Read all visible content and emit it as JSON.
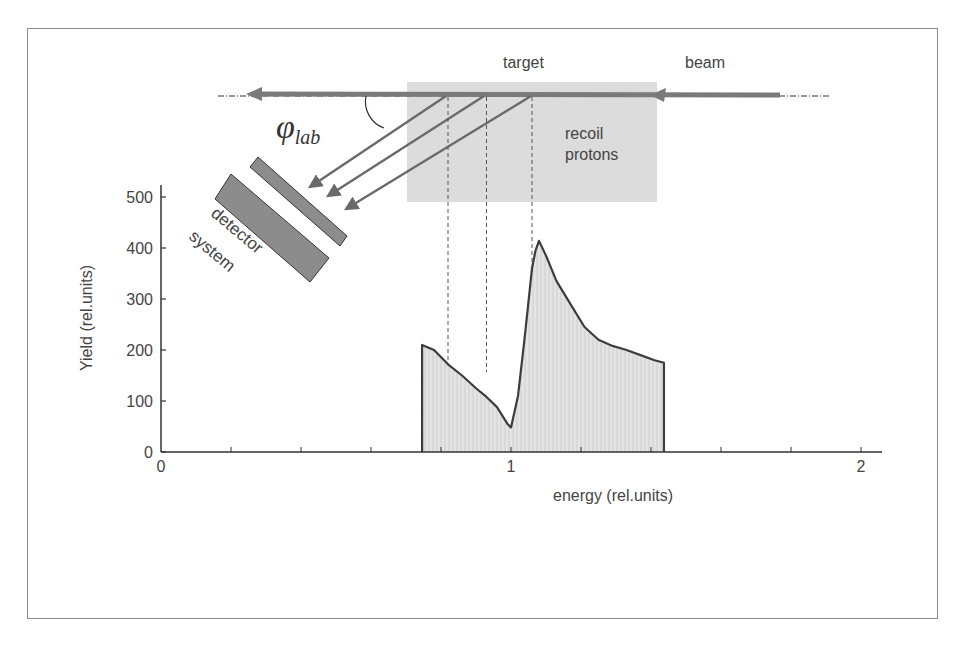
{
  "diagram": {
    "labels": {
      "target": "target",
      "beam": "beam",
      "phi": "φ",
      "phi_sub": "lab",
      "recoil_line1": "recoil",
      "recoil_line2": "protons",
      "detector_line1": "detector",
      "detector_line2": "system"
    },
    "colors": {
      "beam": "#7a7a7a",
      "target_box": "#dcdcdc",
      "detector": "#8c8c8c",
      "arrows": "#6a6a6a",
      "histogram_fill": "#e4e4e4",
      "histogram_outline": "#3c3c3c",
      "axis": "#333333",
      "text": "#444444"
    }
  },
  "chart_data": {
    "type": "area",
    "title": "",
    "xlabel": "energy (rel.units)",
    "ylabel": "Yield (rel.units)",
    "xlim": [
      0,
      2.05
    ],
    "ylim": [
      0,
      520
    ],
    "x_ticks": [
      "0",
      "1",
      "2"
    ],
    "y_ticks": [
      "0",
      "100",
      "200",
      "300",
      "400",
      "500"
    ],
    "grid": false,
    "legend": null,
    "series": [
      {
        "name": "recoil proton spectrum",
        "x": [
          0.746,
          0.78,
          0.82,
          0.86,
          0.9,
          0.93,
          0.96,
          0.99,
          1.0,
          1.02,
          1.04,
          1.06,
          1.07,
          1.08,
          1.1,
          1.13,
          1.17,
          1.21,
          1.25,
          1.29,
          1.33,
          1.37,
          1.41,
          1.437
        ],
        "values": [
          210,
          200,
          172,
          150,
          125,
          108,
          88,
          55,
          48,
          110,
          230,
          360,
          395,
          414,
          385,
          335,
          290,
          245,
          220,
          208,
          200,
          190,
          180,
          175
        ]
      }
    ],
    "annotations": [
      {
        "type": "dashed-vline",
        "x": 0.82
      },
      {
        "type": "dashed-vline",
        "x": 0.93
      },
      {
        "type": "dashed-vline",
        "x": 1.06
      }
    ]
  }
}
